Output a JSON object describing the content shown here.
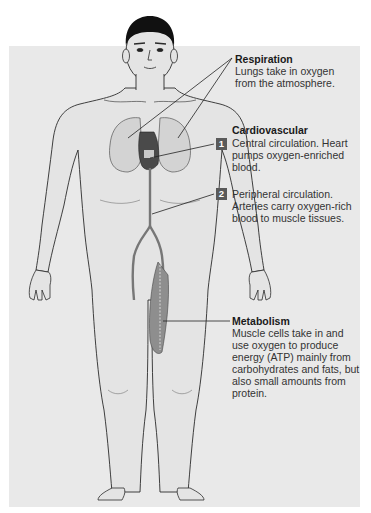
{
  "diagram": {
    "colors": {
      "panel_background": "#e9e9e9",
      "body_fill": "#e6e6e6",
      "outline": "#2b2b2b",
      "organ_fill": "#d4d4d4",
      "artery": "#7a7a7a",
      "muscle": "#8c8c8c",
      "badge_bg": "#5a5a5a",
      "badge_text": "#ffffff"
    },
    "labels": {
      "respiration": {
        "title": "Respiration",
        "body": "Lungs take in oxygen from the atmosphere."
      },
      "cardiovascular": {
        "title": "Cardiovascular",
        "step1": {
          "badge": "1",
          "body": "Central circulation. Heart pumps oxygen-enriched blood."
        },
        "step2": {
          "badge": "2",
          "body": "Peripheral circulation. Arteries carry oxygen-rich blood to muscle tissues."
        }
      },
      "metabolism": {
        "title": "Metabolism",
        "body": "Muscle cells take in and use oxygen to produce energy (ATP) mainly from carbohydrates and fats, but also small amounts from protein."
      }
    }
  }
}
